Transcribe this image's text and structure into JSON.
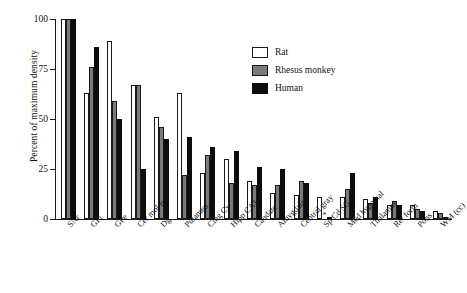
{
  "chart_data": {
    "type": "bar",
    "title": "",
    "xlabel": "",
    "ylabel": "Percent of maximum density",
    "ylim": [
      0,
      100
    ],
    "yticks": [
      0,
      25,
      50,
      75,
      100
    ],
    "grid": false,
    "legend_position": "upper-right",
    "categories": [
      "SNr",
      "GPi",
      "GPe",
      "Cer mol lyr",
      "Dg",
      "Putamen",
      "Cing Cx",
      "Hipp CA1",
      "Caudate",
      "Amygdala",
      "Central gray",
      "Sp Cd SG",
      "Med hypothal",
      "Thalamus",
      "Ret form",
      "Pons",
      "WM (cc)"
    ],
    "series": [
      {
        "name": "Rat",
        "color": "#ffffff",
        "values": [
          100,
          63,
          89,
          67,
          51,
          63,
          23,
          30,
          19,
          13,
          12,
          11,
          11,
          10,
          7,
          7,
          4
        ]
      },
      {
        "name": "Rhesus monkey",
        "color": "#7a7a7a",
        "values": [
          100,
          76,
          59,
          67,
          46,
          22,
          32,
          18,
          17,
          17,
          19,
          null,
          15,
          8,
          9,
          5,
          3
        ]
      },
      {
        "name": "Human",
        "color": "#0d0d0d",
        "values": [
          100,
          86,
          50,
          25,
          40,
          41,
          36,
          34,
          26,
          25,
          18,
          1,
          23,
          11,
          7,
          4,
          1
        ]
      }
    ],
    "annotations": [
      {
        "category": "Sp Cd SG",
        "series": "Rhesus monkey",
        "marker": "*",
        "meaning": "no data"
      }
    ]
  },
  "legend": {
    "items": [
      {
        "label": "Rat",
        "swatch": "rat"
      },
      {
        "label": "Rhesus monkey",
        "swatch": "monkey"
      },
      {
        "label": "Human",
        "swatch": "human"
      }
    ]
  }
}
